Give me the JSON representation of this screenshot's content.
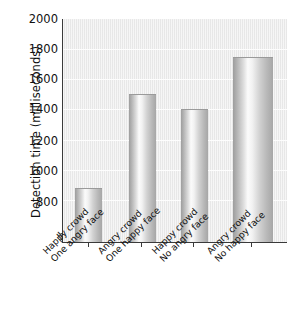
{
  "chart_data": {
    "type": "bar",
    "title": "",
    "xlabel": "",
    "ylabel": "Detection time (milliseconds)",
    "categories": [
      "Happy crowd One angry face",
      "Angry crowd One happy face",
      "Happy crowd No angry face",
      "Angry crowd No happy face"
    ],
    "category_lines": [
      [
        "Happy crowd",
        "One angry face"
      ],
      [
        "Angry crowd",
        "One happy face"
      ],
      [
        "Happy crowd",
        "No angry face"
      ],
      [
        "Angry crowd",
        "No happy face"
      ]
    ],
    "values": [
      880,
      1500,
      1400,
      1750
    ],
    "ylim": [
      520,
      2000
    ],
    "yticks": [
      800,
      1000,
      1200,
      1400,
      1600,
      1800,
      2000
    ],
    "ytick_labels": [
      "800",
      "1000",
      "1200",
      "1400",
      "1600",
      "1800",
      "2000"
    ],
    "axis_break": true,
    "axis_break_symbol": "//",
    "grid": true,
    "legend": "none",
    "bar_style": "3d-cylinder-gradient",
    "colors": {
      "plot_background": "#ececec",
      "gridline": "#fdfdfd",
      "axis": "#3a3a3a",
      "bar_light": "#fbfbfb",
      "bar_dark": "#9d9d9d",
      "text": "#111111",
      "page_background": "#ffffff"
    }
  }
}
